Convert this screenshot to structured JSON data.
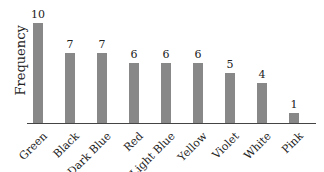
{
  "chart_data": {
    "type": "bar",
    "title": "",
    "xlabel": "",
    "ylabel": "Frequency",
    "categories": [
      "Green",
      "Black",
      "Dark Blue",
      "Red",
      "Light Blue",
      "Yellow",
      "Violet",
      "White",
      "Pink"
    ],
    "values": [
      10,
      7,
      7,
      6,
      6,
      6,
      5,
      4,
      1
    ],
    "ylim": [
      0,
      10
    ],
    "grid": false,
    "legend": null,
    "bar_color": "#888888",
    "data_labels": true
  }
}
